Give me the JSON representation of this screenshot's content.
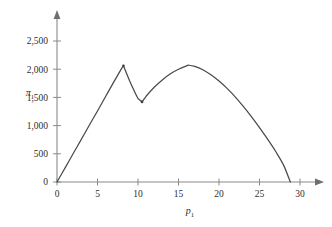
{
  "chart_data": {
    "type": "line",
    "title": "",
    "subtitle": "",
    "xlabel": "p₁",
    "ylabel": "π₁",
    "xlabel_base": "p",
    "xlabel_sub": "1",
    "ylabel_base": "π",
    "ylabel_sub": "1",
    "xlim": [
      0,
      30
    ],
    "ylim": [
      0,
      2500
    ],
    "grid": false,
    "legend": "none",
    "xticks": [
      0,
      5,
      10,
      15,
      20,
      25,
      30
    ],
    "xtick_labels": [
      "0",
      "5",
      "10",
      "15",
      "20",
      "25",
      "30"
    ],
    "yticks": [
      0,
      500,
      1000,
      1500,
      2000,
      2500
    ],
    "ytick_labels": [
      "0",
      "500",
      "1,000",
      "1,500",
      "2,000",
      "2,500"
    ],
    "series": [
      {
        "name": "profit",
        "color": "#4a4a4a",
        "x": [
          0,
          1,
          2,
          3,
          4,
          5,
          6,
          7,
          8,
          8.2,
          9,
          10,
          10.5,
          11,
          12,
          13,
          14,
          15,
          16,
          16.3,
          17,
          18,
          19,
          20,
          21,
          22,
          23,
          24,
          25,
          26,
          27,
          28,
          28.8
        ],
        "values": [
          0,
          250,
          505,
          755,
          1010,
          1260,
          1515,
          1770,
          2020,
          2060,
          1780,
          1480,
          1420,
          1520,
          1680,
          1810,
          1920,
          2000,
          2060,
          2070,
          2050,
          1990,
          1900,
          1790,
          1660,
          1510,
          1340,
          1160,
          965,
          760,
          540,
          290,
          0
        ]
      }
    ],
    "annotations": {
      "first_peak": {
        "x": 8.2,
        "y": 2060
      },
      "kink_trough": {
        "x": 10.5,
        "y": 1420
      },
      "second_peak": {
        "x": 16.3,
        "y": 2070
      },
      "zero_crossing": {
        "x": 28.8,
        "y": 0
      }
    },
    "markers": [
      {
        "x": 8.2,
        "y": 2060
      },
      {
        "x": 10.5,
        "y": 1420
      }
    ]
  },
  "axes": {
    "x_arrow": "arrow-right",
    "y_arrow": "arrow-up",
    "line_color": "#8a8a8a"
  }
}
